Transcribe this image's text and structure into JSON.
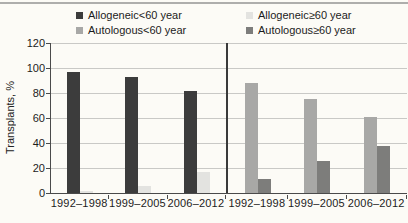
{
  "figure": {
    "background": "#fcfbf6",
    "accent_dark": "#3c3c3c"
  },
  "legend": {
    "position": "top",
    "entries": [
      {
        "label": "Allogeneic<60 year",
        "color": "#3c3c3c"
      },
      {
        "label": "Allogeneic≥60 year",
        "color": "#e3e3e0"
      },
      {
        "label": "Autologous<60 year",
        "color": "#a8a8a6"
      },
      {
        "label": "Autologous≥60 year",
        "color": "#7d7d7b"
      }
    ]
  },
  "chart_data": {
    "type": "bar",
    "title": "",
    "xlabel": "",
    "ylabel": "Transplants, %",
    "ylim": [
      0,
      120
    ],
    "yticks": [
      0,
      20,
      40,
      60,
      80,
      100,
      120
    ],
    "grid": true,
    "legend_position": "top",
    "panels": [
      {
        "name": "allogeneic",
        "categories": [
          "1992–1998",
          "1999–2005",
          "2006–2012"
        ],
        "series": [
          {
            "name": "Allogeneic<60 year",
            "color": "#3c3c3c",
            "values": [
              97,
              93,
              82
            ]
          },
          {
            "name": "Allogeneic≥60 year",
            "color": "#e3e3e0",
            "values": [
              2,
              6,
              17
            ]
          }
        ]
      },
      {
        "name": "autologous",
        "categories": [
          "1992–1998",
          "1999–2005",
          "2006–2012"
        ],
        "series": [
          {
            "name": "Autologous<60 year",
            "color": "#a8a8a6",
            "values": [
              88,
              75,
              61
            ]
          },
          {
            "name": "Autologous≥60 year",
            "color": "#7d7d7b",
            "values": [
              11,
              26,
              38
            ]
          }
        ]
      }
    ]
  }
}
